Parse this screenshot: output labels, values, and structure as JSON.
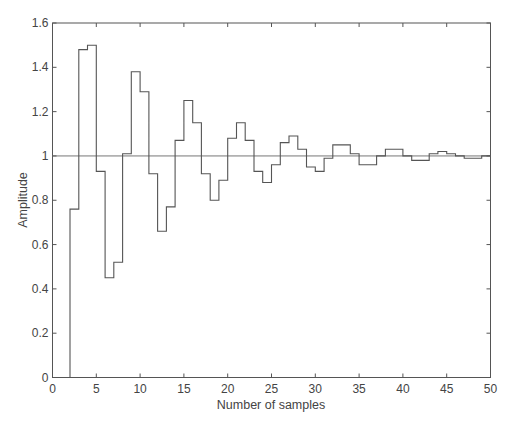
{
  "chart_data": {
    "type": "line",
    "style": "stairs",
    "title": "",
    "xlabel": "Number of samples",
    "ylabel": "Amplitude",
    "xlim": [
      0,
      50
    ],
    "ylim": [
      0,
      1.6
    ],
    "xticks": [
      0,
      5,
      10,
      15,
      20,
      25,
      30,
      35,
      40,
      45,
      50
    ],
    "yticks": [
      0,
      0.2,
      0.4,
      0.6,
      0.8,
      1,
      1.2,
      1.4,
      1.6
    ],
    "ytick_labels": [
      "0",
      "0.2",
      "0.4",
      "0.6",
      "0.8",
      "1",
      "1.2",
      "1.4",
      "1.6"
    ],
    "grid": false,
    "legend": null,
    "reference_line": {
      "y": 1,
      "label": ""
    },
    "series": [
      {
        "name": "step response",
        "x": [
          0,
          1,
          2,
          3,
          4,
          5,
          6,
          7,
          8,
          9,
          10,
          11,
          12,
          13,
          14,
          15,
          16,
          17,
          18,
          19,
          20,
          21,
          22,
          23,
          24,
          25,
          26,
          27,
          28,
          29,
          30,
          31,
          32,
          33,
          34,
          35,
          36,
          37,
          38,
          39,
          40,
          41,
          42,
          43,
          44,
          45,
          46,
          47,
          48,
          49
        ],
        "values": [
          0,
          0,
          0.76,
          1.48,
          1.5,
          0.93,
          0.45,
          0.52,
          1.01,
          1.38,
          1.29,
          0.92,
          0.66,
          0.77,
          1.07,
          1.25,
          1.15,
          0.92,
          0.8,
          0.89,
          1.08,
          1.15,
          1.07,
          0.93,
          0.88,
          0.96,
          1.06,
          1.09,
          1.03,
          0.95,
          0.93,
          0.99,
          1.05,
          1.05,
          1.01,
          0.96,
          0.96,
          1.0,
          1.03,
          1.03,
          1.0,
          0.98,
          0.98,
          1.01,
          1.02,
          1.01,
          1.0,
          0.99,
          0.99,
          1.0
        ]
      }
    ],
    "colors": {
      "line": "#555555",
      "axes": "#555555",
      "background": "#ffffff"
    }
  }
}
